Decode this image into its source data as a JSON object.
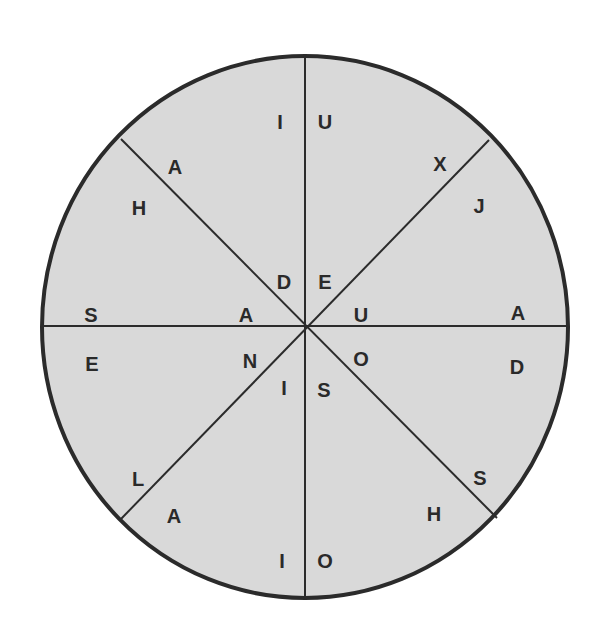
{
  "diagram": {
    "type": "letter-wheel",
    "colors": {
      "fill": "#d9d9d9",
      "stroke": "#2b2b2b",
      "text": "#2a2a2a",
      "background": "#ffffff"
    },
    "circle": {
      "cx": 305,
      "cy": 327,
      "rx": 263,
      "ry": 271
    },
    "spokes": [
      {
        "x1": 305,
        "y1": 56,
        "x2": 305,
        "y2": 598
      },
      {
        "x1": 42,
        "y1": 326,
        "x2": 568,
        "y2": 326
      },
      {
        "x1": 121,
        "y1": 139,
        "x2": 497,
        "y2": 518
      },
      {
        "x1": 489,
        "y1": 140,
        "x2": 120,
        "y2": 520
      }
    ],
    "letters": [
      {
        "char": "I",
        "x": 280,
        "y": 122,
        "sector": "top-left-upper",
        "position": "outer"
      },
      {
        "char": "U",
        "x": 325,
        "y": 122,
        "sector": "top-right-upper",
        "position": "outer"
      },
      {
        "char": "X",
        "x": 440,
        "y": 164,
        "sector": "top-right-upper",
        "position": "outer"
      },
      {
        "char": "J",
        "x": 479,
        "y": 206,
        "sector": "right-upper",
        "position": "outer"
      },
      {
        "char": "A",
        "x": 518,
        "y": 313,
        "sector": "right-upper",
        "position": "outer"
      },
      {
        "char": "D",
        "x": 517,
        "y": 367,
        "sector": "right-lower",
        "position": "outer"
      },
      {
        "char": "S",
        "x": 480,
        "y": 478,
        "sector": "right-lower",
        "position": "outer"
      },
      {
        "char": "H",
        "x": 434,
        "y": 514,
        "sector": "bottom-right",
        "position": "outer"
      },
      {
        "char": "O",
        "x": 325,
        "y": 561,
        "sector": "bottom-right",
        "position": "outer"
      },
      {
        "char": "I",
        "x": 282,
        "y": 561,
        "sector": "bottom-left",
        "position": "outer"
      },
      {
        "char": "A",
        "x": 174,
        "y": 516,
        "sector": "bottom-left",
        "position": "outer"
      },
      {
        "char": "L",
        "x": 138,
        "y": 479,
        "sector": "left-lower",
        "position": "outer"
      },
      {
        "char": "E",
        "x": 92,
        "y": 364,
        "sector": "left-lower",
        "position": "outer"
      },
      {
        "char": "S",
        "x": 91,
        "y": 315,
        "sector": "left-upper",
        "position": "outer"
      },
      {
        "char": "H",
        "x": 139,
        "y": 208,
        "sector": "left-upper",
        "position": "outer"
      },
      {
        "char": "A",
        "x": 175,
        "y": 167,
        "sector": "top-left-upper",
        "position": "outer"
      },
      {
        "char": "D",
        "x": 284,
        "y": 282,
        "sector": "top-left-upper",
        "position": "inner"
      },
      {
        "char": "E",
        "x": 325,
        "y": 282,
        "sector": "top-right-upper",
        "position": "inner"
      },
      {
        "char": "U",
        "x": 361,
        "y": 315,
        "sector": "right-upper",
        "position": "inner"
      },
      {
        "char": "O",
        "x": 361,
        "y": 359,
        "sector": "right-lower",
        "position": "inner"
      },
      {
        "char": "S",
        "x": 324,
        "y": 390,
        "sector": "bottom-right",
        "position": "inner"
      },
      {
        "char": "I",
        "x": 284,
        "y": 388,
        "sector": "bottom-left",
        "position": "inner"
      },
      {
        "char": "N",
        "x": 250,
        "y": 361,
        "sector": "left-lower",
        "position": "inner"
      },
      {
        "char": "A",
        "x": 246,
        "y": 315,
        "sector": "left-upper",
        "position": "inner"
      }
    ]
  }
}
